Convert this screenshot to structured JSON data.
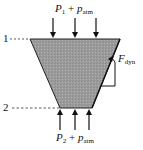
{
  "diagram": {
    "top_label": {
      "var": "P",
      "sub": "1",
      "plus": " + ",
      "var2": "p",
      "sub2": "atm"
    },
    "bottom_label": {
      "var": "P",
      "sub": "2",
      "plus": " + ",
      "var2": "p",
      "sub2": "atm"
    },
    "force_label": {
      "var": "F",
      "sub": "dyn"
    },
    "section_1": "1",
    "section_2": "2",
    "colors": {
      "fill": "#9a9a9a",
      "stroke": "#111111"
    }
  }
}
